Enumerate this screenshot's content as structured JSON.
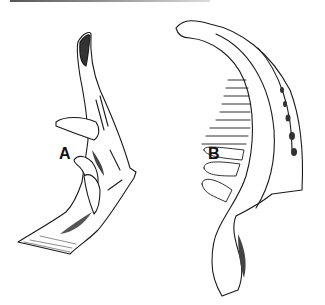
{
  "figure": {
    "labels": {
      "a": "A",
      "b": "B"
    },
    "colors": {
      "ink": "#1a1a1a",
      "paper": "#ffffff"
    }
  }
}
